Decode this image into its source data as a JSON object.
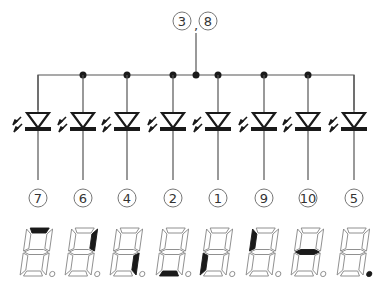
{
  "diagram": {
    "common_pin_label": "③,⑧",
    "common_pins": [
      "3",
      "8"
    ],
    "wire_color": "#555555",
    "ink_color": "#1a1a1a",
    "segment_outline_color": "#888888",
    "segment_active_color": "#1a1a1a",
    "leds": [
      {
        "pin": "7",
        "pin_label": "⑦",
        "segment": "a"
      },
      {
        "pin": "6",
        "pin_label": "⑥",
        "segment": "b"
      },
      {
        "pin": "4",
        "pin_label": "④",
        "segment": "c"
      },
      {
        "pin": "2",
        "pin_label": "②",
        "segment": "d"
      },
      {
        "pin": "1",
        "pin_label": "①",
        "segment": "e"
      },
      {
        "pin": "9",
        "pin_label": "⑨",
        "segment": "f"
      },
      {
        "pin": "10",
        "pin_label": "⑩",
        "segment": "g"
      },
      {
        "pin": "5",
        "pin_label": "⑤",
        "segment": "dp"
      }
    ]
  }
}
